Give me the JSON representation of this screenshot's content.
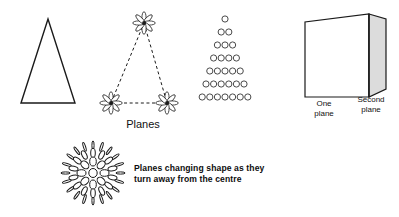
{
  "figure": {
    "title_label": "Planes",
    "bottom_caption": {
      "line1": "Planes changing shape as they",
      "line2": "turn away from the centre"
    },
    "colors": {
      "stroke": "#1a1a1a",
      "plane_fill_front": "#ffffff",
      "plane_fill_side": "#dcdcdc",
      "background": "#ffffff"
    }
  },
  "panels": {
    "solid_triangle": {
      "name": "solid-triangle",
      "points": "21,103 48,19 75,103",
      "fill": "none",
      "stroke_width": 1.4
    },
    "dashed_triangle": {
      "name": "dashed-triangle",
      "points": "144,23 167,103 111,103",
      "dash": "3,2.6",
      "stroke_width": 1,
      "vertices": [
        {
          "id": "apex",
          "cx": 144,
          "cy": 23
        },
        {
          "id": "bottom-left",
          "cx": 111,
          "cy": 103
        },
        {
          "id": "bottom-right",
          "cx": 167,
          "cy": 103
        }
      ],
      "flower": {
        "petals": 8,
        "petal_rx": 2.1,
        "petal_ry": 6.2,
        "core_r": 1.9
      }
    },
    "circle_pyramid": {
      "name": "circle-pyramid",
      "rows": [
        1,
        2,
        3,
        4,
        5,
        6,
        7
      ],
      "row_labels": [
        "row-1",
        "row-2",
        "row-3",
        "row-4",
        "row-5",
        "row-6",
        "row-7"
      ],
      "circle_radius": 3.1,
      "spacing_x": 7.6,
      "spacing_y": 13.0,
      "origin_x": 225,
      "origin_y": 19
    },
    "two_planes": {
      "name": "two-planes-diagram",
      "front_plane": {
        "label_line1": "One",
        "label_line2": "plane",
        "points": "305,22 305,97 369,97 369,14"
      },
      "side_plane": {
        "label_line1": "Second",
        "label_line2": "plane",
        "points": "369,14 386,19 386,89 369,97"
      },
      "hinge_x": 369
    },
    "sphere_cluster": {
      "name": "sphere-of-planes",
      "cx": 92,
      "cy": 172,
      "radius": 31,
      "description": "planes foreshortening toward the edge of a sphere",
      "rings": [
        {
          "id": "ring-outer",
          "r": 27.5,
          "count": 20,
          "rx": 1.1,
          "ry": 4.6
        },
        {
          "id": "ring-second",
          "r": 20.0,
          "count": 14,
          "rx": 2.3,
          "ry": 4.6
        },
        {
          "id": "ring-third",
          "r": 11.5,
          "count": 8,
          "rx": 3.3,
          "ry": 4.5
        },
        {
          "id": "ring-centre",
          "r": 0.0,
          "count": 1,
          "rx": 4.2,
          "ry": 4.5
        }
      ]
    }
  }
}
